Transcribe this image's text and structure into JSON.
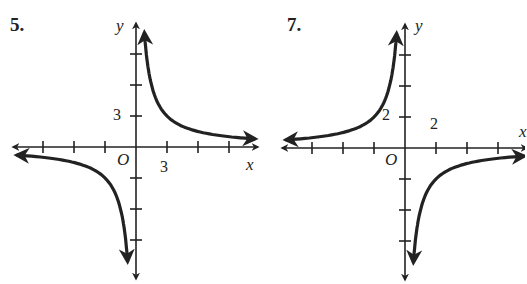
{
  "chart_data": [
    {
      "type": "line",
      "problem_label": "5.",
      "xlabel": "x",
      "ylabel": "y",
      "origin_label": "O",
      "tick_step": 3,
      "x_tick_label": "3",
      "y_tick_label": "3",
      "xlim": [
        -12,
        12
      ],
      "ylim": [
        -12,
        12
      ],
      "function": "y = 9/x",
      "k": 1,
      "origin_px": [
        136,
        147
      ]
    },
    {
      "type": "line",
      "problem_label": "7.",
      "xlabel": "x",
      "ylabel": "y",
      "origin_label": "O",
      "tick_step": 2,
      "x_tick_label": "2",
      "y_tick_label": "2",
      "xlim": [
        -8,
        8
      ],
      "ylim": [
        -8,
        8
      ],
      "function": "y = -4/x",
      "k": -1,
      "origin_px": [
        405,
        148
      ]
    }
  ]
}
